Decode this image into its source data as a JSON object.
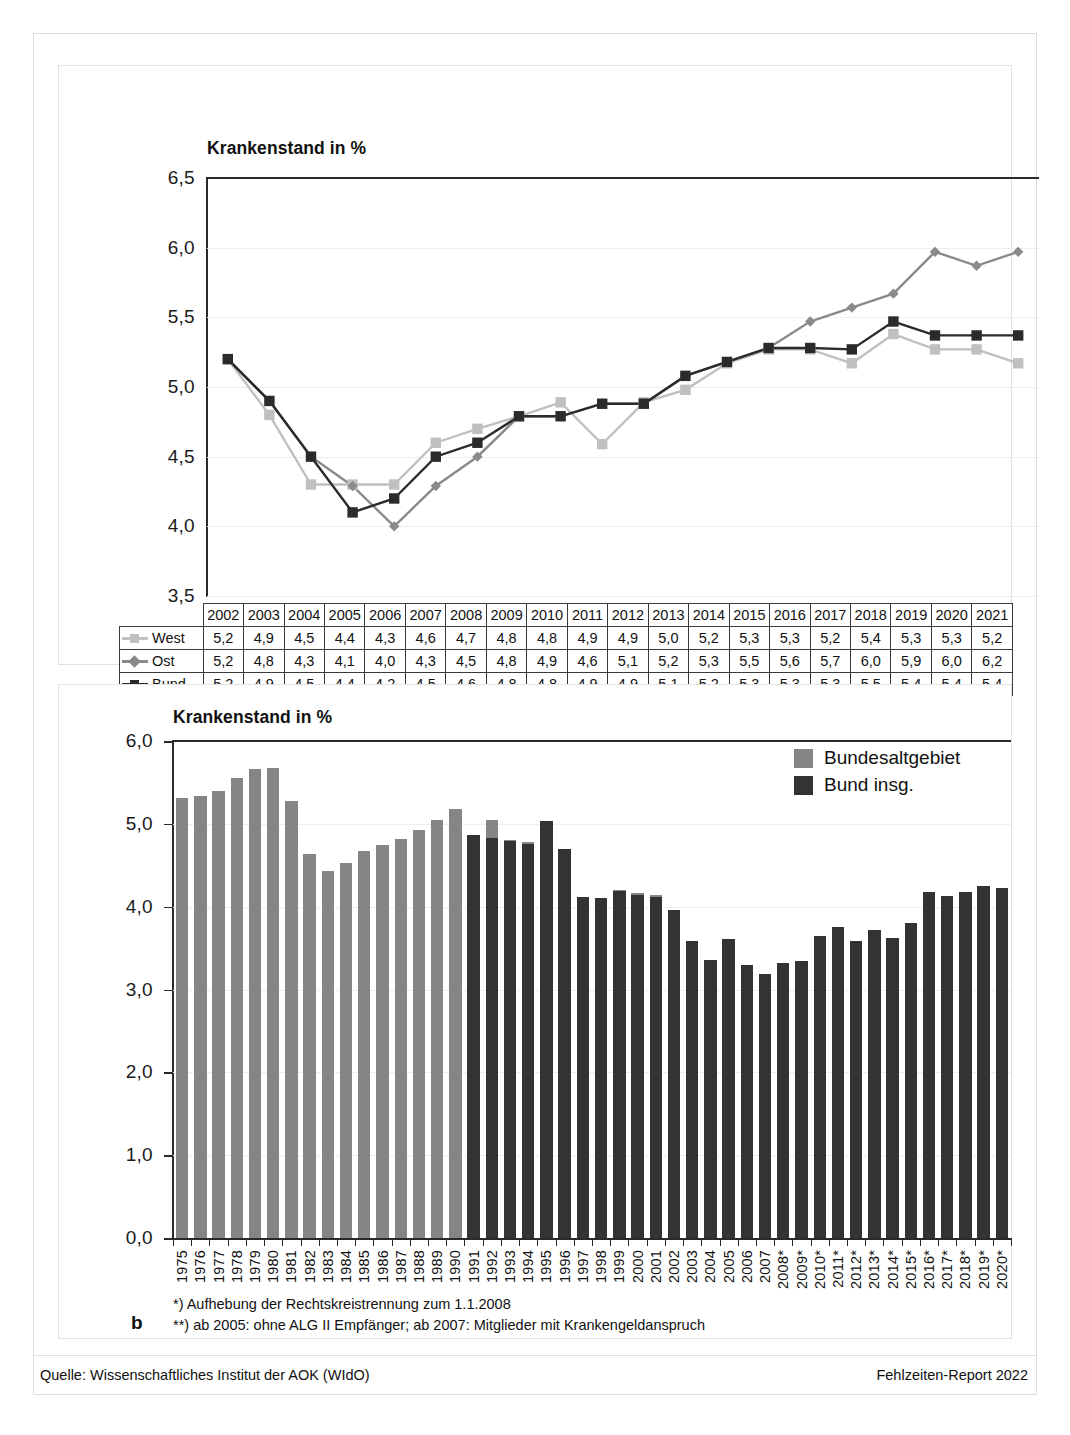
{
  "figure": {
    "panel_a_letter": "a",
    "panel_b_letter": "b",
    "source_left": "Quelle: Wissenschaftliches Institut der AOK (WIdO)",
    "source_right": "Fehlzeiten-Report 2022"
  },
  "panel_a": {
    "title": "Krankenstand  in %",
    "table_corner": "",
    "series_labels": [
      "West",
      "Ost",
      "Bund"
    ],
    "colors": {
      "west": "#c0c0c0",
      "ost": "#8a8a8a",
      "bund": "#2b2b2b"
    }
  },
  "panel_b": {
    "title": "Krankenstand in %",
    "legend": [
      "Bundesaltgebiet",
      "Bund insg."
    ],
    "colors": {
      "bundesaltgebiet": "#858585",
      "bund_insg": "#333333"
    },
    "footnote_1": "*) Aufhebung der Rechtskreistrennung zum 1.1.2008",
    "footnote_2": "**) ab 2005: ohne ALG II Empfänger; ab 2007: Mitglieder mit Krankengeldanspruch"
  },
  "chart_data": [
    {
      "type": "line",
      "id": "panel-a",
      "title": "Krankenstand  in %",
      "xlabel": "",
      "ylabel": "",
      "ylim": [
        3.5,
        6.5
      ],
      "yticks": [
        "3,5",
        "4,0",
        "4,5",
        "5,0",
        "5,5",
        "6,0",
        "6,5"
      ],
      "ytick_values": [
        3.5,
        4.0,
        4.5,
        5.0,
        5.5,
        6.0,
        6.5
      ],
      "grid": true,
      "legend_position": "table-left",
      "categories": [
        "2002",
        "2003",
        "2004",
        "2005",
        "2006",
        "2007",
        "2008",
        "2009",
        "2010",
        "2011",
        "2012",
        "2013",
        "2014",
        "2015",
        "2016",
        "2017",
        "2018",
        "2019",
        "2020",
        "2021"
      ],
      "series": [
        {
          "name": "West",
          "marker": "square",
          "color": "#c0c0c0",
          "labels": [
            "5,2",
            "4,9",
            "4,5",
            "4,4",
            "4,3",
            "4,6",
            "4,7",
            "4,8",
            "4,8",
            "4,9",
            "4,9",
            "5,0",
            "5,2",
            "5,3",
            "5,3",
            "5,2",
            "5,4",
            "5,3",
            "5,3",
            "5,2"
          ],
          "values": [
            5.2,
            4.8,
            4.3,
            4.3,
            4.3,
            4.6,
            4.7,
            4.79,
            4.89,
            4.59,
            4.89,
            4.98,
            5.17,
            5.27,
            5.27,
            5.17,
            5.38,
            5.27,
            5.27,
            5.17
          ]
        },
        {
          "name": "Ost",
          "marker": "diamond",
          "color": "#8a8a8a",
          "labels": [
            "5,2",
            "4,8",
            "4,3",
            "4,1",
            "4,0",
            "4,3",
            "4,5",
            "4,8",
            "4,9",
            "4,6",
            "5,1",
            "5,2",
            "5,3",
            "5,5",
            "5,6",
            "5,7",
            "6,0",
            "5,9",
            "6,0",
            "6,2"
          ],
          "values": [
            5.2,
            4.9,
            4.5,
            4.29,
            4.0,
            4.29,
            4.5,
            4.79,
            4.79,
            4.88,
            4.88,
            5.08,
            5.18,
            5.28,
            5.47,
            5.57,
            5.67,
            5.97,
            5.87,
            5.97
          ]
        },
        {
          "name": "Bund",
          "marker": "square",
          "color": "#2b2b2b",
          "labels": [
            "5,2",
            "4,9",
            "4,5",
            "4,4",
            "4,2",
            "4,5",
            "4,6",
            "4,8",
            "4,8",
            "4,9",
            "4,9",
            "5,1",
            "5,2",
            "5,3",
            "5,3",
            "5,3",
            "5,5",
            "5,4",
            "5,4",
            "5,4"
          ],
          "values": [
            5.2,
            4.9,
            4.5,
            4.1,
            4.2,
            4.5,
            4.6,
            4.79,
            4.79,
            4.88,
            4.88,
            5.08,
            5.18,
            5.28,
            5.28,
            5.27,
            5.47,
            5.37,
            5.37,
            5.37
          ]
        }
      ],
      "table": {
        "header": [
          "2002",
          "2003",
          "2004",
          "2005",
          "2006",
          "2007",
          "2008",
          "2009",
          "2010",
          "2011",
          "2012",
          "2013",
          "2014",
          "2015",
          "2016",
          "2017",
          "2018",
          "2019",
          "2020",
          "2021"
        ],
        "rows": [
          {
            "label": "West",
            "cells": [
              "5,2",
              "4,9",
              "4,5",
              "4,4",
              "4,3",
              "4,6",
              "4,7",
              "4,8",
              "4,8",
              "4,9",
              "4,9",
              "5,0",
              "5,2",
              "5,3",
              "5,3",
              "5,2",
              "5,4",
              "5,3",
              "5,3",
              "5,2"
            ]
          },
          {
            "label": "Ost",
            "cells": [
              "5,2",
              "4,8",
              "4,3",
              "4,1",
              "4,0",
              "4,3",
              "4,5",
              "4,8",
              "4,9",
              "4,6",
              "5,1",
              "5,2",
              "5,3",
              "5,5",
              "5,6",
              "5,7",
              "6,0",
              "5,9",
              "6,0",
              "6,2"
            ]
          },
          {
            "label": "Bund",
            "cells": [
              "5,2",
              "4,9",
              "4,5",
              "4,4",
              "4,2",
              "4,5",
              "4,6",
              "4,8",
              "4,8",
              "4,9",
              "4,9",
              "5,1",
              "5,2",
              "5,3",
              "5,3",
              "5,3",
              "5,5",
              "5,4",
              "5,4",
              "5,4"
            ]
          }
        ]
      }
    },
    {
      "type": "bar",
      "id": "panel-b",
      "title": "Krankenstand in %",
      "xlabel": "",
      "ylabel": "",
      "ylim": [
        0.0,
        6.0
      ],
      "yticks": [
        "0,0",
        "1,0",
        "2,0",
        "3,0",
        "4,0",
        "5,0",
        "6,0"
      ],
      "ytick_values": [
        0.0,
        1.0,
        2.0,
        3.0,
        4.0,
        5.0,
        6.0
      ],
      "grid": true,
      "legend_position": "top-right",
      "legend": [
        "Bundesaltgebiet",
        "Bund insg."
      ],
      "categories": [
        "1975",
        "1976",
        "1977",
        "1978",
        "1979",
        "1980",
        "1981",
        "1982",
        "1983",
        "1984",
        "1985",
        "1986",
        "1987",
        "1988",
        "1989",
        "1990",
        "1991",
        "1992",
        "1993",
        "1994",
        "1995",
        "1996",
        "1997",
        "1998",
        "1999",
        "2000",
        "2001",
        "2002",
        "2003",
        "2004",
        "2005",
        "2006",
        "2007",
        "2008*",
        "2009*",
        "2010*",
        "2011*",
        "2012*",
        "2013*",
        "2014*",
        "2015*",
        "2016*",
        "2017*",
        "2018*",
        "2019*",
        "2020*"
      ],
      "series": [
        {
          "name": "Bundesaltgebiet",
          "color": "#858585",
          "values": [
            5.31,
            5.34,
            5.4,
            5.55,
            5.66,
            5.67,
            5.27,
            4.63,
            4.43,
            4.53,
            4.67,
            4.74,
            4.82,
            4.93,
            5.05,
            5.18,
            4.86,
            5.05,
            4.8,
            4.78,
            4.8,
            4.66,
            4.1,
            4.07,
            4.2,
            4.16,
            4.14,
            3.96,
            3.54,
            3.33,
            3.56,
            3.26,
            3.16,
            null,
            null,
            null,
            null,
            null,
            null,
            null,
            null,
            null,
            null,
            null,
            null,
            null
          ]
        },
        {
          "name": "Bund insg.",
          "color": "#333333",
          "values": [
            null,
            null,
            null,
            null,
            null,
            null,
            null,
            null,
            null,
            null,
            null,
            null,
            null,
            null,
            null,
            null,
            4.86,
            4.83,
            4.79,
            4.76,
            5.04,
            4.7,
            4.12,
            4.1,
            4.19,
            4.14,
            4.12,
            3.96,
            3.58,
            3.36,
            3.61,
            3.29,
            3.19,
            3.32,
            3.34,
            3.65,
            3.76,
            3.59,
            3.72,
            3.62,
            3.8,
            4.18,
            4.13,
            4.18,
            4.25,
            4.22
          ]
        }
      ]
    }
  ]
}
